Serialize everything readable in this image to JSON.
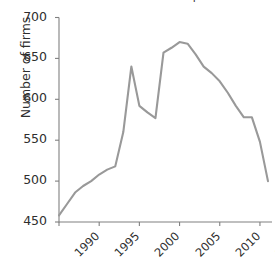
{
  "chart_data": {
    "type": "line",
    "title": "Number of firms in the UK professional services industry",
    "title_clipped": true,
    "xlabel": "",
    "ylabel": "Number of firms",
    "xlim": [
      1990,
      2016.5
    ],
    "ylim": [
      450,
      700
    ],
    "yticks": [
      450,
      500,
      550,
      600,
      650,
      700
    ],
    "ytick_labels": [
      "450",
      "500",
      "550",
      "600",
      "650",
      "700"
    ],
    "xticks": [
      1990,
      1995,
      2000,
      2005,
      2010,
      2015
    ],
    "xtick_labels": [
      "1990",
      "1995",
      "2000",
      "2005",
      "2010",
      "2015"
    ],
    "xtick_rotation": -45,
    "grid": false,
    "legend": false,
    "line_color": "#999999",
    "axis_color": "#808080",
    "text_color": "#2e2e2e",
    "series": [
      {
        "name": "Number of firms",
        "color": "#999999",
        "x": [
          1990,
          1991,
          1992,
          1993,
          1994,
          1995,
          1996,
          1997,
          1998,
          1999,
          2000,
          2001,
          2002,
          2003,
          2004,
          2005,
          2006,
          2007,
          2008,
          2009,
          2010,
          2011,
          2012,
          2013,
          2014,
          2015,
          2016
        ],
        "values": [
          458,
          472,
          486,
          494,
          500,
          508,
          514,
          518,
          560,
          640,
          592,
          584,
          577,
          657,
          663,
          670,
          668,
          655,
          640,
          632,
          622,
          608,
          592,
          578,
          578,
          548,
          500
        ]
      }
    ]
  }
}
